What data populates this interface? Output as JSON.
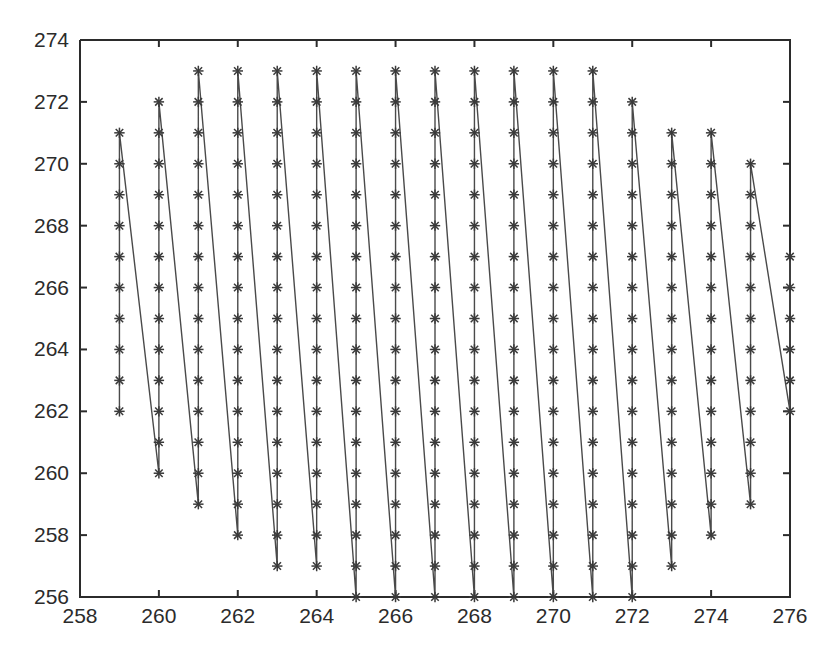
{
  "figure": {
    "background_color": "#ffffff",
    "axes_color": "#2b2b2b",
    "line_color": "#4a4a4a",
    "marker_color": "#3a3a3a",
    "marker_symbol": "asterisk"
  },
  "chart_data": {
    "type": "line",
    "title": "",
    "xlabel": "",
    "ylabel": "",
    "xlim": [
      258,
      276
    ],
    "ylim": [
      256,
      274
    ],
    "grid": false,
    "legend": null,
    "xticks": [
      258,
      260,
      262,
      264,
      266,
      268,
      270,
      272,
      274,
      276
    ],
    "yticks": [
      256,
      258,
      260,
      262,
      264,
      266,
      268,
      270,
      272,
      274
    ],
    "xtick_labels": [
      "258",
      "260",
      "262",
      "264",
      "266",
      "268",
      "270",
      "272",
      "274",
      "276"
    ],
    "ytick_labels": [
      "256",
      "258",
      "260",
      "262",
      "264",
      "266",
      "268",
      "270",
      "272",
      "274"
    ],
    "marker": "*",
    "columns": [
      {
        "x": 259,
        "y_min": 262,
        "y_max": 271
      },
      {
        "x": 260,
        "y_min": 260,
        "y_max": 272
      },
      {
        "x": 261,
        "y_min": 259,
        "y_max": 273
      },
      {
        "x": 262,
        "y_min": 258,
        "y_max": 273
      },
      {
        "x": 263,
        "y_min": 257,
        "y_max": 273
      },
      {
        "x": 264,
        "y_min": 257,
        "y_max": 273
      },
      {
        "x": 265,
        "y_min": 256,
        "y_max": 273
      },
      {
        "x": 266,
        "y_min": 256,
        "y_max": 273
      },
      {
        "x": 267,
        "y_min": 256,
        "y_max": 273
      },
      {
        "x": 268,
        "y_min": 256,
        "y_max": 273
      },
      {
        "x": 269,
        "y_min": 256,
        "y_max": 273
      },
      {
        "x": 270,
        "y_min": 256,
        "y_max": 273
      },
      {
        "x": 271,
        "y_min": 256,
        "y_max": 273
      },
      {
        "x": 272,
        "y_min": 256,
        "y_max": 272
      },
      {
        "x": 273,
        "y_min": 257,
        "y_max": 271
      },
      {
        "x": 274,
        "y_min": 258,
        "y_max": 271
      },
      {
        "x": 275,
        "y_min": 259,
        "y_max": 270
      },
      {
        "x": 276,
        "y_min": 262,
        "y_max": 267
      }
    ],
    "points": [
      [
        259,
        262
      ],
      [
        259,
        263
      ],
      [
        259,
        264
      ],
      [
        259,
        265
      ],
      [
        259,
        266
      ],
      [
        259,
        267
      ],
      [
        259,
        268
      ],
      [
        259,
        269
      ],
      [
        259,
        270
      ],
      [
        259,
        271
      ],
      [
        260,
        260
      ],
      [
        260,
        261
      ],
      [
        260,
        262
      ],
      [
        260,
        263
      ],
      [
        260,
        264
      ],
      [
        260,
        265
      ],
      [
        260,
        266
      ],
      [
        260,
        267
      ],
      [
        260,
        268
      ],
      [
        260,
        269
      ],
      [
        260,
        270
      ],
      [
        260,
        271
      ],
      [
        260,
        272
      ],
      [
        261,
        259
      ],
      [
        261,
        260
      ],
      [
        261,
        261
      ],
      [
        261,
        262
      ],
      [
        261,
        263
      ],
      [
        261,
        264
      ],
      [
        261,
        265
      ],
      [
        261,
        266
      ],
      [
        261,
        267
      ],
      [
        261,
        268
      ],
      [
        261,
        269
      ],
      [
        261,
        270
      ],
      [
        261,
        271
      ],
      [
        261,
        272
      ],
      [
        261,
        273
      ],
      [
        262,
        258
      ],
      [
        262,
        259
      ],
      [
        262,
        260
      ],
      [
        262,
        261
      ],
      [
        262,
        262
      ],
      [
        262,
        263
      ],
      [
        262,
        264
      ],
      [
        262,
        265
      ],
      [
        262,
        266
      ],
      [
        262,
        267
      ],
      [
        262,
        268
      ],
      [
        262,
        269
      ],
      [
        262,
        270
      ],
      [
        262,
        271
      ],
      [
        262,
        272
      ],
      [
        262,
        273
      ],
      [
        263,
        257
      ],
      [
        263,
        258
      ],
      [
        263,
        259
      ],
      [
        263,
        260
      ],
      [
        263,
        261
      ],
      [
        263,
        262
      ],
      [
        263,
        263
      ],
      [
        263,
        264
      ],
      [
        263,
        265
      ],
      [
        263,
        266
      ],
      [
        263,
        267
      ],
      [
        263,
        268
      ],
      [
        263,
        269
      ],
      [
        263,
        270
      ],
      [
        263,
        271
      ],
      [
        263,
        272
      ],
      [
        263,
        273
      ],
      [
        264,
        257
      ],
      [
        264,
        258
      ],
      [
        264,
        259
      ],
      [
        264,
        260
      ],
      [
        264,
        261
      ],
      [
        264,
        262
      ],
      [
        264,
        263
      ],
      [
        264,
        264
      ],
      [
        264,
        265
      ],
      [
        264,
        266
      ],
      [
        264,
        267
      ],
      [
        264,
        268
      ],
      [
        264,
        269
      ],
      [
        264,
        270
      ],
      [
        264,
        271
      ],
      [
        264,
        272
      ],
      [
        264,
        273
      ],
      [
        265,
        256
      ],
      [
        265,
        257
      ],
      [
        265,
        258
      ],
      [
        265,
        259
      ],
      [
        265,
        260
      ],
      [
        265,
        261
      ],
      [
        265,
        262
      ],
      [
        265,
        263
      ],
      [
        265,
        264
      ],
      [
        265,
        265
      ],
      [
        265,
        266
      ],
      [
        265,
        267
      ],
      [
        265,
        268
      ],
      [
        265,
        269
      ],
      [
        265,
        270
      ],
      [
        265,
        271
      ],
      [
        265,
        272
      ],
      [
        265,
        273
      ],
      [
        266,
        256
      ],
      [
        266,
        257
      ],
      [
        266,
        258
      ],
      [
        266,
        259
      ],
      [
        266,
        260
      ],
      [
        266,
        261
      ],
      [
        266,
        262
      ],
      [
        266,
        263
      ],
      [
        266,
        264
      ],
      [
        266,
        265
      ],
      [
        266,
        266
      ],
      [
        266,
        267
      ],
      [
        266,
        268
      ],
      [
        266,
        269
      ],
      [
        266,
        270
      ],
      [
        266,
        271
      ],
      [
        266,
        272
      ],
      [
        266,
        273
      ],
      [
        267,
        256
      ],
      [
        267,
        257
      ],
      [
        267,
        258
      ],
      [
        267,
        259
      ],
      [
        267,
        260
      ],
      [
        267,
        261
      ],
      [
        267,
        262
      ],
      [
        267,
        263
      ],
      [
        267,
        264
      ],
      [
        267,
        265
      ],
      [
        267,
        266
      ],
      [
        267,
        267
      ],
      [
        267,
        268
      ],
      [
        267,
        269
      ],
      [
        267,
        270
      ],
      [
        267,
        271
      ],
      [
        267,
        272
      ],
      [
        267,
        273
      ],
      [
        268,
        256
      ],
      [
        268,
        257
      ],
      [
        268,
        258
      ],
      [
        268,
        259
      ],
      [
        268,
        260
      ],
      [
        268,
        261
      ],
      [
        268,
        262
      ],
      [
        268,
        263
      ],
      [
        268,
        264
      ],
      [
        268,
        265
      ],
      [
        268,
        266
      ],
      [
        268,
        267
      ],
      [
        268,
        268
      ],
      [
        268,
        269
      ],
      [
        268,
        270
      ],
      [
        268,
        271
      ],
      [
        268,
        272
      ],
      [
        268,
        273
      ],
      [
        269,
        256
      ],
      [
        269,
        257
      ],
      [
        269,
        258
      ],
      [
        269,
        259
      ],
      [
        269,
        260
      ],
      [
        269,
        261
      ],
      [
        269,
        262
      ],
      [
        269,
        263
      ],
      [
        269,
        264
      ],
      [
        269,
        265
      ],
      [
        269,
        266
      ],
      [
        269,
        267
      ],
      [
        269,
        268
      ],
      [
        269,
        269
      ],
      [
        269,
        270
      ],
      [
        269,
        271
      ],
      [
        269,
        272
      ],
      [
        269,
        273
      ],
      [
        270,
        256
      ],
      [
        270,
        257
      ],
      [
        270,
        258
      ],
      [
        270,
        259
      ],
      [
        270,
        260
      ],
      [
        270,
        261
      ],
      [
        270,
        262
      ],
      [
        270,
        263
      ],
      [
        270,
        264
      ],
      [
        270,
        265
      ],
      [
        270,
        266
      ],
      [
        270,
        267
      ],
      [
        270,
        268
      ],
      [
        270,
        269
      ],
      [
        270,
        270
      ],
      [
        270,
        271
      ],
      [
        270,
        272
      ],
      [
        270,
        273
      ],
      [
        271,
        256
      ],
      [
        271,
        257
      ],
      [
        271,
        258
      ],
      [
        271,
        259
      ],
      [
        271,
        260
      ],
      [
        271,
        261
      ],
      [
        271,
        262
      ],
      [
        271,
        263
      ],
      [
        271,
        264
      ],
      [
        271,
        265
      ],
      [
        271,
        266
      ],
      [
        271,
        267
      ],
      [
        271,
        268
      ],
      [
        271,
        269
      ],
      [
        271,
        270
      ],
      [
        271,
        271
      ],
      [
        271,
        272
      ],
      [
        271,
        273
      ],
      [
        272,
        256
      ],
      [
        272,
        257
      ],
      [
        272,
        258
      ],
      [
        272,
        259
      ],
      [
        272,
        260
      ],
      [
        272,
        261
      ],
      [
        272,
        262
      ],
      [
        272,
        263
      ],
      [
        272,
        264
      ],
      [
        272,
        265
      ],
      [
        272,
        266
      ],
      [
        272,
        267
      ],
      [
        272,
        268
      ],
      [
        272,
        269
      ],
      [
        272,
        270
      ],
      [
        272,
        271
      ],
      [
        272,
        272
      ],
      [
        273,
        257
      ],
      [
        273,
        258
      ],
      [
        273,
        259
      ],
      [
        273,
        260
      ],
      [
        273,
        261
      ],
      [
        273,
        262
      ],
      [
        273,
        263
      ],
      [
        273,
        264
      ],
      [
        273,
        265
      ],
      [
        273,
        266
      ],
      [
        273,
        267
      ],
      [
        273,
        268
      ],
      [
        273,
        269
      ],
      [
        273,
        270
      ],
      [
        273,
        271
      ],
      [
        274,
        258
      ],
      [
        274,
        259
      ],
      [
        274,
        260
      ],
      [
        274,
        261
      ],
      [
        274,
        262
      ],
      [
        274,
        263
      ],
      [
        274,
        264
      ],
      [
        274,
        265
      ],
      [
        274,
        266
      ],
      [
        274,
        267
      ],
      [
        274,
        268
      ],
      [
        274,
        269
      ],
      [
        274,
        270
      ],
      [
        274,
        271
      ],
      [
        275,
        259
      ],
      [
        275,
        260
      ],
      [
        275,
        261
      ],
      [
        275,
        262
      ],
      [
        275,
        263
      ],
      [
        275,
        264
      ],
      [
        275,
        265
      ],
      [
        275,
        266
      ],
      [
        275,
        267
      ],
      [
        275,
        268
      ],
      [
        275,
        269
      ],
      [
        275,
        270
      ],
      [
        276,
        262
      ],
      [
        276,
        263
      ],
      [
        276,
        264
      ],
      [
        276,
        265
      ],
      [
        276,
        266
      ],
      [
        276,
        267
      ]
    ]
  }
}
